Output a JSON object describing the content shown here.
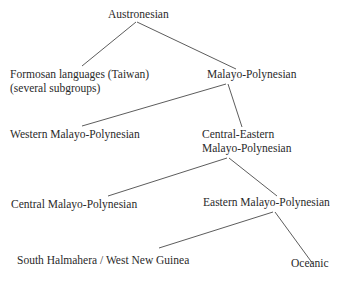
{
  "diagram": {
    "type": "tree",
    "nodes": [
      {
        "id": "austronesian",
        "label": "Austronesian"
      },
      {
        "id": "formosan",
        "label": "Formosan languages (Taiwan)",
        "sublabel": "(several subgroups)"
      },
      {
        "id": "malayo_polynesian",
        "label": "Malayo-Polynesian"
      },
      {
        "id": "western_mp",
        "label": "Western Malayo-Polynesian"
      },
      {
        "id": "central_eastern_mp",
        "label": "Central-Eastern",
        "sublabel": "Malayo-Polynesian"
      },
      {
        "id": "central_mp",
        "label": "Central Malayo-Polynesian"
      },
      {
        "id": "eastern_mp",
        "label": "Eastern Malayo-Polynesian"
      },
      {
        "id": "shwng",
        "label": "South Halmahera / West New Guinea"
      },
      {
        "id": "oceanic",
        "label": "Oceanic"
      }
    ],
    "edges": [
      [
        "austronesian",
        "formosan"
      ],
      [
        "austronesian",
        "malayo_polynesian"
      ],
      [
        "malayo_polynesian",
        "western_mp"
      ],
      [
        "malayo_polynesian",
        "central_eastern_mp"
      ],
      [
        "central_eastern_mp",
        "central_mp"
      ],
      [
        "central_eastern_mp",
        "eastern_mp"
      ],
      [
        "eastern_mp",
        "shwng"
      ],
      [
        "eastern_mp",
        "oceanic"
      ]
    ]
  }
}
